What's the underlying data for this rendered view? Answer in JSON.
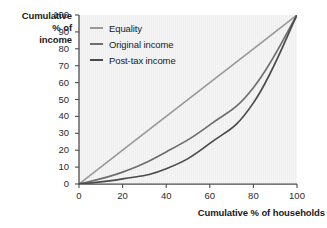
{
  "chart_data": {
    "type": "line",
    "title": "",
    "xlabel": "Cumulative % of households",
    "ylabel": "Cumulative % of income",
    "ylabel_lines": [
      "Cumulative",
      "% of",
      "income"
    ],
    "xlim": [
      0,
      100
    ],
    "ylim": [
      0,
      100
    ],
    "xticks": [
      0,
      20,
      40,
      60,
      80,
      100
    ],
    "yticks": [
      0,
      10,
      20,
      30,
      40,
      50,
      60,
      70,
      80,
      90,
      100
    ],
    "xtick_labels": [
      "0",
      "20",
      "40",
      "60",
      "80",
      "100"
    ],
    "ytick_labels": [
      "0",
      "10",
      "20",
      "30",
      "40",
      "50",
      "60",
      "70",
      "80",
      "90",
      "100"
    ],
    "grid": false,
    "legend_position": "top-left-inside",
    "plot_background": "#f2f2f2",
    "axis_color": "#4d4d4d",
    "x": [
      0,
      20,
      40,
      60,
      80,
      100
    ],
    "series": [
      {
        "name": "Equality",
        "color": "#9a9a9a",
        "values": [
          0,
          20,
          40,
          60,
          80,
          100
        ]
      },
      {
        "name": "Original income",
        "color": "#6e6e6e",
        "values": [
          0,
          7,
          19,
          35,
          57,
          100
        ]
      },
      {
        "name": "Post-tax income",
        "color": "#4a4a4a",
        "values": [
          0,
          3,
          9,
          24,
          48,
          100
        ]
      }
    ]
  },
  "legend": {
    "items": [
      {
        "label": "Equality",
        "color": "#9a9a9a"
      },
      {
        "label": "Original income",
        "color": "#6e6e6e"
      },
      {
        "label": "Post-tax income",
        "color": "#4a4a4a"
      }
    ]
  }
}
